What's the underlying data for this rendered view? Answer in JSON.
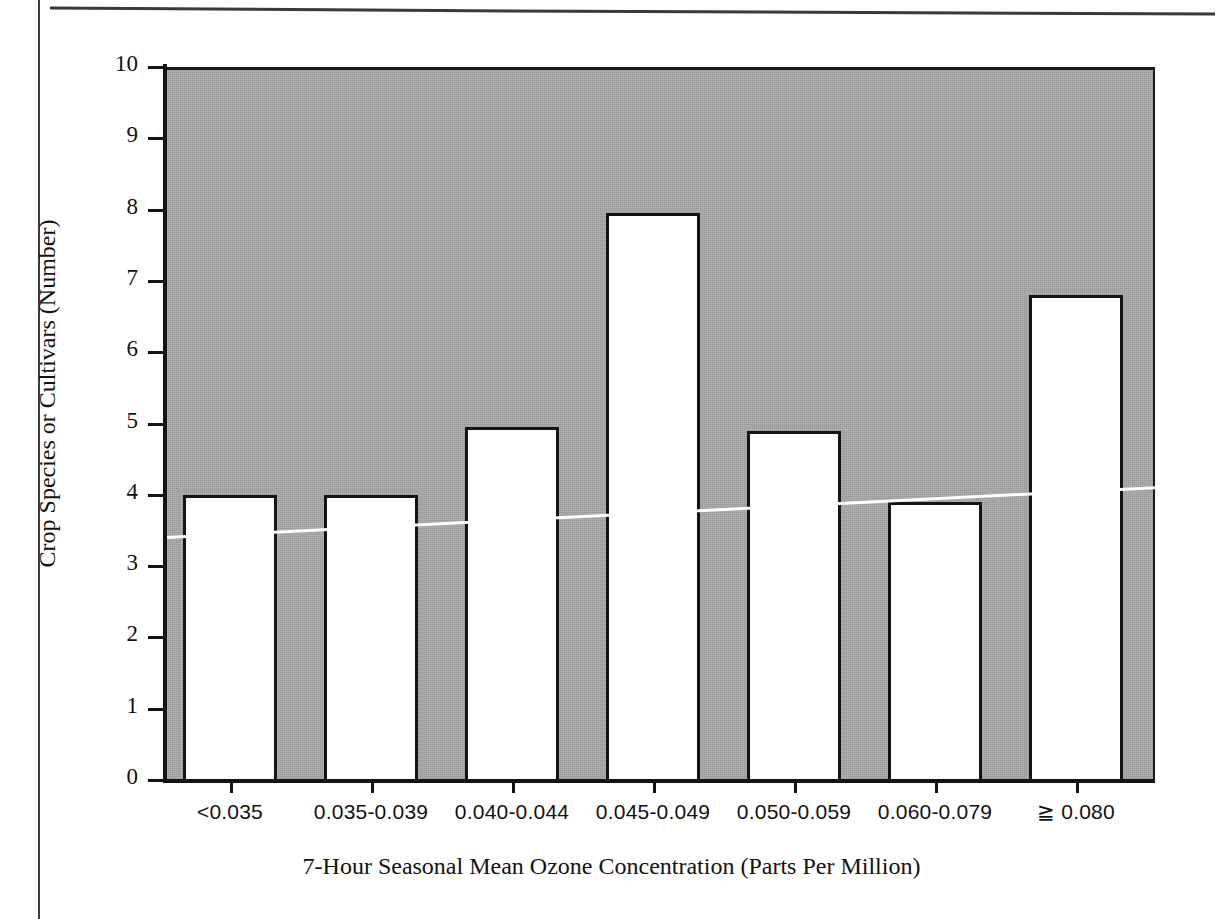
{
  "chart_data": {
    "type": "bar",
    "title": "",
    "xlabel": "7-Hour Seasonal Mean Ozone Concentration (Parts Per Million)",
    "ylabel": "Crop Species or Cultivars (Number)",
    "categories": [
      "<0.035",
      "0.035-0.039",
      "0.040-0.044",
      "0.045-0.049",
      "0.050-0.059",
      "0.060-0.079",
      "≧ 0.080"
    ],
    "values": [
      4.0,
      4.0,
      4.95,
      7.95,
      4.9,
      3.9,
      6.8
    ],
    "ylim": [
      0,
      10
    ],
    "xlim_note": "categorical, 7 bins",
    "ytick_labels": [
      "0",
      "1",
      "2",
      "3",
      "4",
      "5",
      "6",
      "7",
      "8",
      "9",
      "10"
    ],
    "ytick_values": [
      0,
      1,
      2,
      3,
      4,
      5,
      6,
      7,
      8,
      9,
      10
    ],
    "grid": false,
    "legend": "none",
    "plot_background_color": "#a8a8a8",
    "bar_fill_color": "#ffffff",
    "bar_edge_color": "#141414",
    "annotations": [
      {
        "name": "trend-line",
        "type": "line",
        "color": "#ffffff",
        "start_value": 3.4,
        "end_value": 4.1,
        "description": "white trend line rising left to right across plot"
      }
    ]
  },
  "axes": {
    "y_ticks": [
      {
        "label": "10",
        "value": 10
      },
      {
        "label": "9",
        "value": 9
      },
      {
        "label": "8",
        "value": 8
      },
      {
        "label": "7",
        "value": 7
      },
      {
        "label": "6",
        "value": 6
      },
      {
        "label": "5",
        "value": 5
      },
      {
        "label": "4",
        "value": 4
      },
      {
        "label": "3",
        "value": 3
      },
      {
        "label": "2",
        "value": 2
      },
      {
        "label": "1",
        "value": 1
      },
      {
        "label": "0",
        "value": 0
      }
    ],
    "x_title": "7-Hour Seasonal Mean Ozone Concentration (Parts Per Million)",
    "y_title": "Crop Species or Cultivars (Number)"
  }
}
